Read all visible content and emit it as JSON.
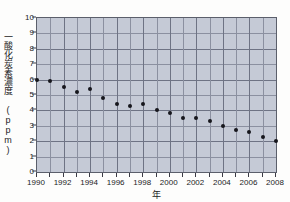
{
  "chart_data": {
    "type": "scatter",
    "title": "",
    "xlabel": "年",
    "ylabel": "一酸化炭素濃度（ppm）",
    "ylabel_text": "一酸化炭素濃度 (ppm)",
    "xlim": [
      1990,
      2008
    ],
    "ylim": [
      0,
      10
    ],
    "grid": true,
    "legend": "none",
    "x_tick_labels": [
      "1990",
      "1992",
      "1994",
      "1996",
      "1998",
      "2000",
      "2002",
      "2004",
      "2006",
      "2008"
    ],
    "x_tick_values": [
      1990,
      1992,
      1994,
      1996,
      1998,
      2000,
      2002,
      2004,
      2006,
      2008
    ],
    "x_minor_ticks": [
      1991,
      1993,
      1995,
      1997,
      1999,
      2001,
      2003,
      2005,
      2007
    ],
    "y_tick_labels": [
      "0",
      "1",
      "2",
      "3",
      "4",
      "5",
      "6",
      "7",
      "8",
      "9",
      "10"
    ],
    "y_tick_values": [
      0,
      1,
      2,
      3,
      4,
      5,
      6,
      7,
      8,
      9,
      10
    ],
    "x": [
      1990,
      1991,
      1992,
      1993,
      1994,
      1995,
      1996,
      1997,
      1998,
      1999,
      2000,
      2001,
      2002,
      2003,
      2004,
      2005,
      2006,
      2007,
      2008
    ],
    "values": [
      6.0,
      5.9,
      5.5,
      5.2,
      5.4,
      4.8,
      4.4,
      4.3,
      4.4,
      4.0,
      3.8,
      3.5,
      3.5,
      3.3,
      3.0,
      2.7,
      2.6,
      2.3,
      2.0
    ],
    "marker": "filled-circle",
    "marker_color": "#16161c",
    "plot_background": "#c5cad6",
    "grid_color": "#8b90a0",
    "axis_color": "#5b5f6b",
    "page_background": "#fdfdfc"
  }
}
